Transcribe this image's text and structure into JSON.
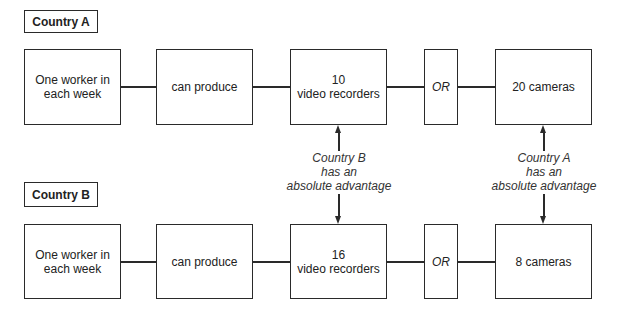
{
  "country_a": {
    "label": "Country A",
    "worker_line1": "One worker in",
    "worker_line2": "each week",
    "verb": "can produce",
    "option1_qty": "10",
    "option1_item": "video recorders",
    "or": "OR",
    "option2": "20 cameras"
  },
  "country_b": {
    "label": "Country B",
    "worker_line1": "One worker in",
    "worker_line2": "each week",
    "verb": "can produce",
    "option1_qty": "16",
    "option1_item": "video recorders",
    "or": "OR",
    "option2": "8 cameras"
  },
  "notes": {
    "left": {
      "line1": "Country B",
      "line2": "has an",
      "line3": "absolute advantage"
    },
    "right": {
      "line1": "Country A",
      "line2": "has an",
      "line3": "absolute advantage"
    }
  }
}
